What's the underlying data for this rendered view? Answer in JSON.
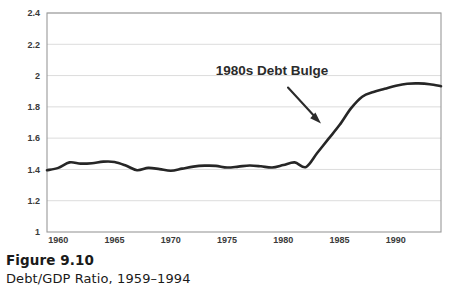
{
  "figure": {
    "caption_title": "Figure 9.10",
    "caption_subtitle": "Debt/GDP Ratio, 1959–1994"
  },
  "chart_data": {
    "type": "line",
    "title": "",
    "subtitle": "",
    "xlabel": "",
    "ylabel": "",
    "xlim": [
      1959,
      1994
    ],
    "ylim": [
      1,
      2.4
    ],
    "grid": true,
    "grid_axis": "y",
    "legend": false,
    "legend_position": "none",
    "line_color": "#262626",
    "grid_color": "#d9d9d9",
    "border_color": "#9a9a9a",
    "background_color": "#ffffff",
    "yticks": [
      1,
      1.2,
      1.4,
      1.6,
      1.8,
      2,
      2.2,
      2.4
    ],
    "ytick_labels": [
      "1",
      "1.2",
      "1.4",
      "1.6",
      "1.8",
      "2",
      "2.2",
      "2.4"
    ],
    "xticks": [
      1960,
      1965,
      1970,
      1975,
      1980,
      1985,
      1990
    ],
    "xtick_labels": [
      "1960",
      "1965",
      "1970",
      "1975",
      "1980",
      "1985",
      "1990"
    ],
    "x": [
      1959,
      1960,
      1961,
      1962,
      1963,
      1964,
      1965,
      1966,
      1967,
      1968,
      1969,
      1970,
      1971,
      1972,
      1973,
      1974,
      1975,
      1976,
      1977,
      1978,
      1979,
      1980,
      1981,
      1982,
      1983,
      1984,
      1985,
      1986,
      1987,
      1988,
      1989,
      1990,
      1991,
      1992,
      1993,
      1994
    ],
    "values": [
      1.395,
      1.41,
      1.445,
      1.437,
      1.44,
      1.45,
      1.448,
      1.425,
      1.395,
      1.41,
      1.402,
      1.392,
      1.405,
      1.418,
      1.424,
      1.423,
      1.412,
      1.418,
      1.425,
      1.42,
      1.412,
      1.428,
      1.445,
      1.415,
      1.505,
      1.595,
      1.685,
      1.79,
      1.865,
      1.895,
      1.915,
      1.935,
      1.948,
      1.95,
      1.945,
      1.932
    ],
    "series": [
      {
        "name": "Debt/GDP Ratio",
        "values": [
          1.395,
          1.41,
          1.445,
          1.437,
          1.44,
          1.45,
          1.448,
          1.425,
          1.395,
          1.41,
          1.402,
          1.392,
          1.405,
          1.418,
          1.424,
          1.423,
          1.412,
          1.418,
          1.425,
          1.42,
          1.412,
          1.428,
          1.445,
          1.415,
          1.505,
          1.595,
          1.685,
          1.79,
          1.865,
          1.895,
          1.915,
          1.935,
          1.948,
          1.95,
          1.945,
          1.932
        ]
      }
    ],
    "annotations": [
      {
        "text": "1980s Debt Bulge",
        "type": "arrow-label",
        "points_to_year": 1984,
        "points_to_value": 1.57
      }
    ]
  }
}
